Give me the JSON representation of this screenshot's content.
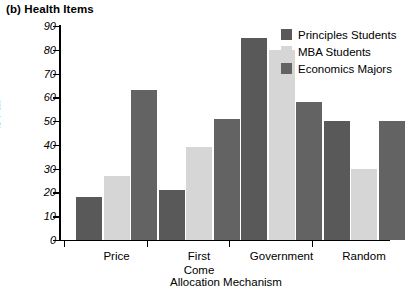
{
  "figure": {
    "caption": "(b) Health Items"
  },
  "chart_data": {
    "type": "bar",
    "title": "(b) Health Items",
    "xlabel": "Allocation Mechanism",
    "ylabel": "Percent Saying Allocation Mechanism is Fair",
    "ylabel_lines": [
      "Percent Saying Allocation Mechanism",
      "is Fair"
    ],
    "ylim": [
      0,
      90
    ],
    "yticks": [
      0,
      10,
      20,
      30,
      40,
      50,
      60,
      70,
      80,
      90
    ],
    "ytick_labels": [
      "0",
      "10",
      "20",
      "30",
      "40",
      "50",
      "60",
      "70",
      "80",
      "90"
    ],
    "grid": false,
    "legend_position": "top-right",
    "categories": [
      "Price",
      "First Come",
      "Government",
      "Random"
    ],
    "category_lines": [
      [
        "Price"
      ],
      [
        "First",
        "Come"
      ],
      [
        "Government"
      ],
      [
        "Random"
      ]
    ],
    "series": [
      {
        "name": "Principles Students",
        "color": "#595959",
        "values": [
          18,
          21,
          85,
          50
        ]
      },
      {
        "name": "MBA Students",
        "color": "#d6d6d6",
        "values": [
          27,
          39,
          80,
          30
        ]
      },
      {
        "name": "Economics Majors",
        "color": "#636363",
        "values": [
          63,
          51,
          58,
          50
        ]
      }
    ]
  }
}
